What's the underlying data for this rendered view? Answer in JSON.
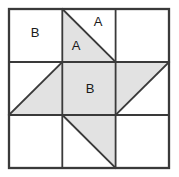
{
  "figure": {
    "type": "geometric-grid-diagram",
    "grid": {
      "columns": 3,
      "rows": 3,
      "left": 9,
      "top": 9,
      "cell_width": 53.3,
      "cell_height": 53,
      "line_color": "#3a3a3a",
      "outer_line_width": 2.2,
      "inner_line_width": 1.8
    },
    "colors": {
      "shaded_fill": "#e2e2e2",
      "unshaded_fill": "#ffffff",
      "stroke": "#3a3a3a",
      "label_text": "#1a1a1a",
      "background": "#ffffff"
    },
    "cells": [
      {
        "id": "cell-r1c1",
        "row": 1,
        "column": 1,
        "fill": "unshaded",
        "shape": "empty-square"
      },
      {
        "id": "cell-r1c2",
        "row": 1,
        "column": 2,
        "fill": "shaded-triangle",
        "shape": "triangle-top-left-bottom-left-bottom-right"
      },
      {
        "id": "cell-r1c3",
        "row": 1,
        "column": 3,
        "fill": "unshaded",
        "shape": "empty-square"
      },
      {
        "id": "cell-r2c1",
        "row": 2,
        "column": 1,
        "fill": "shaded-triangle",
        "shape": "triangle-bottom-left-top-right-bottom-right"
      },
      {
        "id": "cell-r2c2",
        "row": 2,
        "column": 2,
        "fill": "shaded-square",
        "shape": "full-square"
      },
      {
        "id": "cell-r2c3",
        "row": 2,
        "column": 3,
        "fill": "shaded-triangle",
        "shape": "triangle-top-left-top-right-bottom-left"
      },
      {
        "id": "cell-r3c1",
        "row": 3,
        "column": 1,
        "fill": "unshaded",
        "shape": "empty-square"
      },
      {
        "id": "cell-r3c2",
        "row": 3,
        "column": 2,
        "fill": "shaded-triangle",
        "shape": "triangle-top-left-top-right-bottom-right"
      },
      {
        "id": "cell-r3c3",
        "row": 3,
        "column": 3,
        "fill": "unshaded",
        "shape": "empty-square"
      }
    ],
    "labels": [
      {
        "id": "label-b-topleft",
        "text": "B",
        "x": 35,
        "y": 34,
        "cell": "cell-r1c1",
        "region": "white-square"
      },
      {
        "id": "label-a-upper",
        "text": "A",
        "x": 98,
        "y": 23,
        "cell": "cell-r1c2",
        "region": "white-triangle"
      },
      {
        "id": "label-a-lower",
        "text": "A",
        "x": 76,
        "y": 47,
        "cell": "cell-r1c2",
        "region": "shaded-triangle"
      },
      {
        "id": "label-b-center",
        "text": "B",
        "x": 90,
        "y": 90,
        "cell": "cell-r2c2",
        "region": "shaded-square"
      }
    ]
  }
}
